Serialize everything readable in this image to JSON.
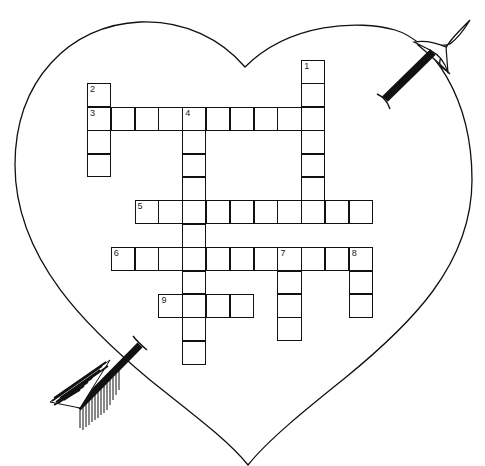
{
  "puzzle": {
    "type": "crossword",
    "theme": "heart with arrow",
    "colors": {
      "line": "#111111",
      "background": "#ffffff"
    },
    "grid": {
      "origin_x": 87,
      "origin_y": 60,
      "cell_w": 23.8,
      "cell_h": 23.4
    },
    "entries": [
      {
        "number": "1",
        "direction": "down",
        "row": 0,
        "col": 9,
        "length": 7
      },
      {
        "number": "2",
        "direction": "down",
        "row": 1,
        "col": 0,
        "length": 4
      },
      {
        "number": "3",
        "direction": "across",
        "row": 2,
        "col": 0,
        "length": 10
      },
      {
        "number": "4",
        "direction": "down",
        "row": 2,
        "col": 4,
        "length": 11
      },
      {
        "number": "5",
        "direction": "across",
        "row": 6,
        "col": 2,
        "length": 10
      },
      {
        "number": "6",
        "direction": "across",
        "row": 8,
        "col": 1,
        "length": 11
      },
      {
        "number": "7",
        "direction": "down",
        "row": 8,
        "col": 8,
        "length": 4
      },
      {
        "number": "8",
        "direction": "down",
        "row": 8,
        "col": 11,
        "length": 3
      },
      {
        "number": "9",
        "direction": "across",
        "row": 10,
        "col": 3,
        "length": 4
      }
    ]
  },
  "decorations": {
    "shape": "heart-outline",
    "arrow": "arrow-through-heart"
  }
}
